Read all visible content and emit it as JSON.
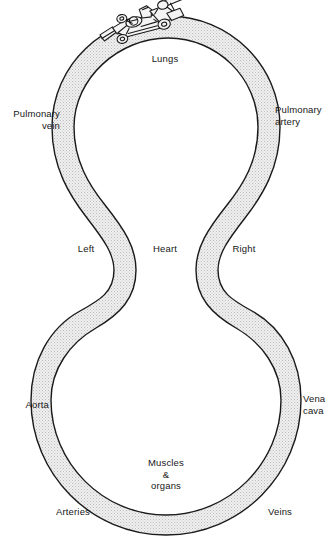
{
  "figure": {
    "type": "anatomical-flow-diagram",
    "shape": "figure-eight-loop",
    "band": {
      "fill_color": "#e9e9e9",
      "stipple_color": "#b9b9b9",
      "stroke_color": "#1a1a1a",
      "stroke_width": 1.3
    },
    "background_color": "#ffffff",
    "illustration": {
      "name": "race-car-line-drawing",
      "position": "top-left-of-upper-loop",
      "stroke_color": "#1a1a1a",
      "fill_color": "#f2f2f2"
    }
  },
  "labels": {
    "lungs": "Lungs",
    "pulmonary_vein": "Pulmonary\nvein",
    "pulmonary_artery": "Pulmonary\nartery",
    "left": "Left",
    "heart": "Heart",
    "right": "Right",
    "aorta": "Aorta",
    "vena_cava": "Vena\ncava",
    "muscles_organs": "Muscles\n&\norgans",
    "arteries": "Arteries",
    "veins": "Veins"
  }
}
